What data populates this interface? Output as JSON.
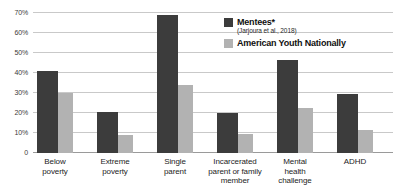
{
  "chart_data": {
    "type": "bar",
    "title": "",
    "subtitle": "",
    "xlabel": "",
    "ylabel": "",
    "ylim": [
      0,
      72
    ],
    "yticks": [
      "0",
      "10%",
      "20%",
      "30%",
      "40%",
      "50%",
      "60%",
      "70%"
    ],
    "ytick_values": [
      0,
      10,
      20,
      30,
      40,
      50,
      60,
      70
    ],
    "grid": true,
    "legend_position": "top-right",
    "categories": [
      "Below poverty",
      "Extreme poverty",
      "Single parent",
      "Incarcerated parent or family member",
      "Mental health challenge",
      "ADHD"
    ],
    "category_lines": [
      [
        "Below",
        "poverty"
      ],
      [
        "Extreme",
        "poverty"
      ],
      [
        "Single",
        "parent"
      ],
      [
        "Incarcerated",
        "parent or family",
        "member"
      ],
      [
        "Mental",
        "health",
        "challenge"
      ],
      [
        "ADHD"
      ]
    ],
    "series": [
      {
        "name": "Mentees*",
        "note": "(Jarjoura et al., 2018)",
        "color": "#3c3c3c",
        "values": [
          41,
          20.5,
          69,
          20,
          46.5,
          29.5
        ]
      },
      {
        "name": "American Youth Nationally",
        "note": "",
        "color": "#b2b2b2",
        "values": [
          30,
          9,
          34,
          9.5,
          22.5,
          11.5
        ]
      }
    ]
  },
  "legend": {
    "entries": [
      {
        "label": "Mentees*",
        "sublabel": "(Jarjoura et al., 2018)"
      },
      {
        "label": "American Youth Nationally",
        "sublabel": ""
      }
    ]
  }
}
